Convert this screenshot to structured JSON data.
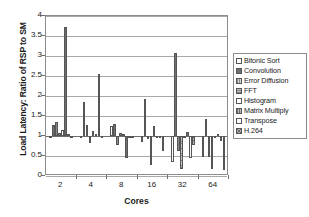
{
  "chart_data": {
    "type": "bar",
    "title": "",
    "xlabel": "Cores",
    "ylabel": "Load Latency: Ratio of RSP to SM",
    "categories": [
      "2",
      "4",
      "8",
      "16",
      "32",
      "64"
    ],
    "ylim": [
      0,
      4
    ],
    "yticks": [
      0,
      0.5,
      1,
      1.5,
      2,
      2.5,
      3,
      3.5,
      4
    ],
    "ytick_labels": [
      "0",
      "0.5",
      "1",
      "1.5",
      "2",
      "2.5",
      "3",
      "3.5",
      "4"
    ],
    "grid": true,
    "legend_position": "right",
    "baseline": 1,
    "series": [
      {
        "name": "Bitonic Sort",
        "values": [
          1.0,
          0.95,
          1.24,
          0.86,
          0.34,
          0.48
        ]
      },
      {
        "name": "Convolution",
        "values": [
          1.27,
          1.85,
          1.31,
          1.93,
          3.08,
          1.42
        ]
      },
      {
        "name": "Error Diffusion",
        "values": [
          1.35,
          1.28,
          0.78,
          0.93,
          0.62,
          0.47
        ]
      },
      {
        "name": "FFT",
        "values": [
          1.08,
          0.83,
          1.08,
          0.28,
          0.18,
          0.18
        ]
      },
      {
        "name": "Histogram",
        "values": [
          1.14,
          1.13,
          1.06,
          1.25,
          1.0,
          0.98
        ]
      },
      {
        "name": "Matrix Multiply",
        "values": [
          3.72,
          1.06,
          0.46,
          0.98,
          1.11,
          1.06
        ]
      },
      {
        "name": "Transpose",
        "values": [
          1.04,
          2.55,
          1.0,
          0.96,
          0.45,
          0.88
        ]
      },
      {
        "name": "H.264",
        "values": [
          1.0,
          0.97,
          0.98,
          0.62,
          0.77,
          0.16
        ]
      }
    ]
  },
  "legend": {
    "items": [
      {
        "label": "Bitonic Sort"
      },
      {
        "label": "Convolution"
      },
      {
        "label": "Error Diffusion"
      },
      {
        "label": "FFT"
      },
      {
        "label": "Histogram"
      },
      {
        "label": "Matrix Multiply"
      },
      {
        "label": "Transpose"
      },
      {
        "label": "H.264"
      }
    ]
  }
}
